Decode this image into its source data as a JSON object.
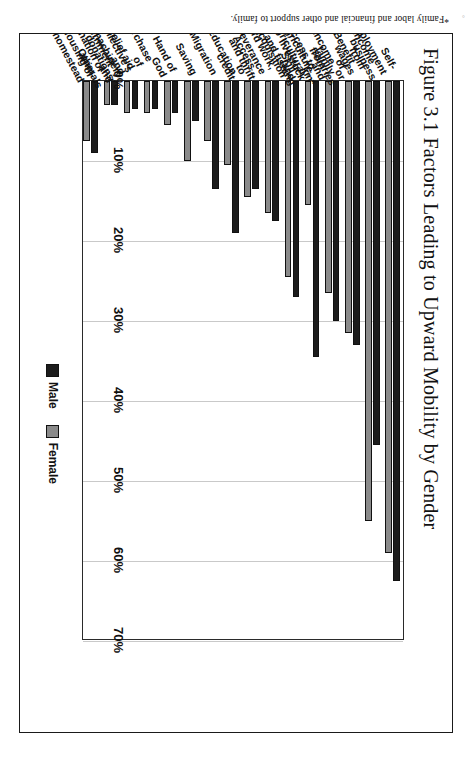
{
  "figure": {
    "frame_visible": true,
    "footnote": "*Family labor and financial and other support to family.",
    "corner_mark": "°"
  },
  "legend": {
    "position": "bottom-right",
    "items": [
      {
        "label": "Male",
        "color": "#1c1c1c",
        "swatch": "legend-swatch-male"
      },
      {
        "label": "Female",
        "color": "#8a8a8a",
        "swatch": "legend-swatch-female"
      }
    ]
  },
  "axis": {
    "ticks": [
      "0%",
      "10%",
      "20%",
      "30%",
      "40%",
      "50%",
      "60%",
      "70%"
    ]
  },
  "chart_data": {
    "type": "bar",
    "orientation": "horizontal",
    "title": "Figure 3.1 Factors Leading to Upward Mobility by Gender",
    "subtitle": "",
    "xlabel": "",
    "ylabel": "",
    "xlim": [
      0,
      70
    ],
    "grid": true,
    "legend_position": "bottom-right",
    "value_suffix": "%",
    "categories": [
      "Self-employment business",
      "Income from wages or salaries",
      "Benefit of family and kin*",
      "Income from agriculture,\nlivestock and fishing",
      "Access to agricultural land",
      "Skill acquisition",
      "Hard work, perseverance\nand thrift",
      "Access to credit",
      "Education",
      "Migration",
      "Saving",
      "Hand of God",
      "Purchase of collective's\nmachinery and animals",
      "Relief aid and donations",
      "Government donation of\nhousing or homestead",
      "Other"
    ],
    "series": [
      {
        "name": "Male",
        "color": "#1c1c1c",
        "values": [
          62.5,
          45.5,
          33.0,
          30.0,
          34.5,
          27.0,
          17.5,
          13.5,
          19.0,
          13.5,
          5.0,
          4.0,
          3.5,
          3.5,
          3.0,
          9.0
        ]
      },
      {
        "name": "Female",
        "color": "#8a8a8a",
        "values": [
          59.0,
          55.0,
          31.5,
          26.5,
          15.5,
          24.5,
          16.5,
          14.5,
          10.5,
          7.5,
          10.0,
          5.5,
          4.0,
          4.0,
          3.0,
          7.5
        ]
      }
    ]
  }
}
